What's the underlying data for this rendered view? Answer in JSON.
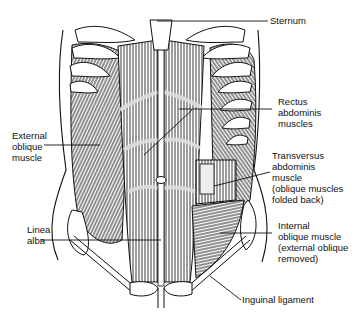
{
  "figure": {
    "type": "anatomical-illustration",
    "colors": {
      "ink": "#111111",
      "background": "#ffffff"
    }
  },
  "labels": {
    "sternum": {
      "lines": [
        "Sternum"
      ]
    },
    "rectus": {
      "lines": [
        "Rectus",
        "abdominis",
        "muscles"
      ]
    },
    "external_oblique": {
      "lines": [
        "External",
        "oblique",
        "muscle"
      ]
    },
    "transversus": {
      "lines": [
        "Transversus",
        "abdominis",
        "muscle",
        "(oblique muscles",
        "folded back)"
      ]
    },
    "linea_alba": {
      "lines": [
        "Linea",
        "alba"
      ]
    },
    "internal_oblique": {
      "lines": [
        "Internal",
        "oblique muscle",
        "(external oblique",
        "removed)"
      ]
    },
    "inguinal": {
      "lines": [
        "Inguinal ligament"
      ]
    }
  }
}
